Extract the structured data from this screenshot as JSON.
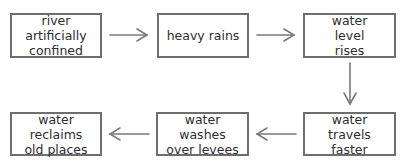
{
  "diagram": {
    "type": "flowchart",
    "clipped_header_text": "",
    "nodes": [
      {
        "id": "n1",
        "label": "river artificially confined"
      },
      {
        "id": "n2",
        "label": "heavy rains"
      },
      {
        "id": "n3",
        "label": "water level rises"
      },
      {
        "id": "n4",
        "label": "water travels faster"
      },
      {
        "id": "n5",
        "label": "water washes over levees"
      },
      {
        "id": "n6",
        "label": "water reclaims old places"
      }
    ],
    "edges": [
      {
        "from": "n1",
        "to": "n2",
        "direction": "right"
      },
      {
        "from": "n2",
        "to": "n3",
        "direction": "right"
      },
      {
        "from": "n3",
        "to": "n4",
        "direction": "down"
      },
      {
        "from": "n4",
        "to": "n5",
        "direction": "left"
      },
      {
        "from": "n5",
        "to": "n6",
        "direction": "left"
      }
    ],
    "colors": {
      "border": "#6e6e6e",
      "arrow": "#7a7a7a",
      "text": "#2e2e2e",
      "background": "#ffffff"
    }
  }
}
